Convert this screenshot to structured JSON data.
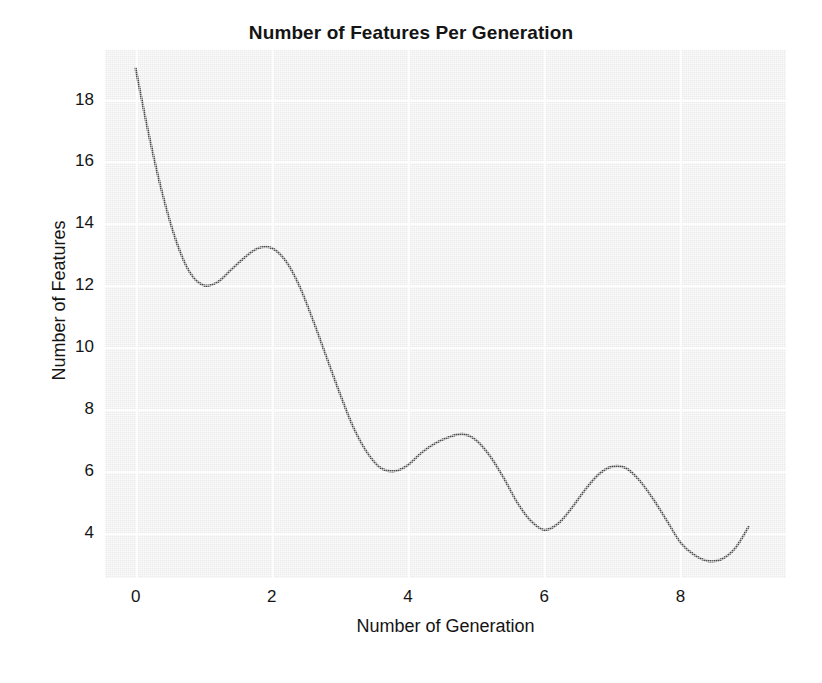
{
  "chart_data": {
    "type": "line",
    "title": "Number of Features Per Generation",
    "xlabel": "Number of Generation",
    "ylabel": "Number of Features",
    "xlim": [
      -0.45,
      9.55
    ],
    "ylim": [
      2.55,
      19.6
    ],
    "xticks": [
      0,
      2,
      4,
      6,
      8
    ],
    "xtick_labels": [
      "0",
      "2",
      "4",
      "6",
      "8"
    ],
    "yticks": [
      4,
      6,
      8,
      10,
      12,
      14,
      16,
      18
    ],
    "ytick_labels": [
      "4",
      "6",
      "8",
      "10",
      "12",
      "14",
      "16",
      "18"
    ],
    "grid": true,
    "grid_color": "#fdfdfd",
    "plot_bgcolor": "#ebebeb",
    "figure_bgcolor": "#ffffff",
    "legend": null,
    "series": [
      {
        "name": "Number of Features",
        "color": "#4a4a4a",
        "linewidth": 2.4,
        "x": [
          0.0,
          0.2,
          0.4,
          0.6,
          0.8,
          1.0,
          1.2,
          1.4,
          1.6,
          1.8,
          2.0,
          2.2,
          2.4,
          2.6,
          2.8,
          3.0,
          3.2,
          3.4,
          3.6,
          3.8,
          4.0,
          4.2,
          4.4,
          4.6,
          4.8,
          5.0,
          5.2,
          5.4,
          5.6,
          5.8,
          6.0,
          6.2,
          6.4,
          6.6,
          6.8,
          7.0,
          7.2,
          7.4,
          7.6,
          7.8,
          8.0,
          8.2,
          8.4,
          8.6,
          8.8,
          9.0
        ],
        "y": [
          19.0,
          16.8,
          14.9,
          13.4,
          12.4,
          12.0,
          12.1,
          12.5,
          12.9,
          13.2,
          13.2,
          12.8,
          12.0,
          10.9,
          9.7,
          8.5,
          7.4,
          6.6,
          6.1,
          6.0,
          6.2,
          6.6,
          6.9,
          7.1,
          7.2,
          7.0,
          6.5,
          5.8,
          5.0,
          4.4,
          4.1,
          4.3,
          4.8,
          5.4,
          5.9,
          6.15,
          6.1,
          5.7,
          5.1,
          4.4,
          3.7,
          3.3,
          3.1,
          3.15,
          3.5,
          4.2
        ]
      }
    ],
    "annotations": {
      "local_minimum_1": {
        "x": 1.0,
        "y": 12.0
      },
      "local_maximum_1": {
        "x": 1.85,
        "y": 13.2
      },
      "local_minimum_2": {
        "x": 3.85,
        "y": 6.0
      },
      "local_maximum_2": {
        "x": 4.8,
        "y": 7.2
      },
      "local_minimum_3": {
        "x": 6.0,
        "y": 4.1
      },
      "local_maximum_3": {
        "x": 7.05,
        "y": 6.2
      },
      "local_minimum_4": {
        "x": 8.45,
        "y": 3.1
      },
      "start_point": {
        "x": 0.0,
        "y": 19.0
      },
      "end_point": {
        "x": 9.0,
        "y": 4.2
      }
    }
  }
}
